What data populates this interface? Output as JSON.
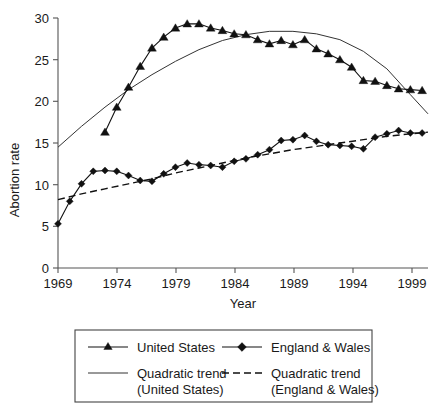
{
  "chart_data": {
    "type": "line",
    "title": "",
    "xlabel": "Year",
    "ylabel": "Abortion rate",
    "xlim": [
      1969,
      2000.5
    ],
    "ylim": [
      0,
      30
    ],
    "xticks": [
      1969,
      1974,
      1979,
      1984,
      1989,
      1994,
      1999
    ],
    "yticks": [
      0,
      5,
      10,
      15,
      20,
      25,
      30
    ],
    "grid": false,
    "legend_position": "below-plot",
    "series": [
      {
        "name": "United States",
        "marker": "triangle",
        "line_style": "solid",
        "x": [
          1973,
          1974,
          1975,
          1976,
          1977,
          1978,
          1979,
          1980,
          1981,
          1982,
          1983,
          1984,
          1985,
          1986,
          1987,
          1988,
          1989,
          1990,
          1991,
          1992,
          1993,
          1994,
          1995,
          1996,
          1997,
          1998,
          1999,
          2000
        ],
        "values": [
          16.3,
          19.3,
          21.7,
          24.2,
          26.4,
          27.7,
          28.8,
          29.3,
          29.3,
          28.8,
          28.5,
          28.1,
          28.0,
          27.4,
          26.9,
          27.3,
          26.8,
          27.4,
          26.3,
          25.7,
          25.0,
          24.1,
          22.5,
          22.4,
          21.9,
          21.5,
          21.4,
          21.3
        ]
      },
      {
        "name": "England & Wales",
        "marker": "diamond",
        "line_style": "solid",
        "x": [
          1969,
          1970,
          1971,
          1972,
          1973,
          1974,
          1975,
          1976,
          1977,
          1978,
          1979,
          1980,
          1981,
          1982,
          1983,
          1984,
          1985,
          1986,
          1987,
          1988,
          1989,
          1990,
          1991,
          1992,
          1993,
          1994,
          1995,
          1996,
          1997,
          1998,
          1999,
          2000
        ],
        "values": [
          5.3,
          8.0,
          10.1,
          11.6,
          11.7,
          11.6,
          11.1,
          10.5,
          10.4,
          11.3,
          12.1,
          12.6,
          12.4,
          12.3,
          12.1,
          12.8,
          13.1,
          13.6,
          14.2,
          15.3,
          15.4,
          15.9,
          15.2,
          14.8,
          14.7,
          14.6,
          14.3,
          15.7,
          16.1,
          16.5,
          16.2,
          16.2
        ]
      }
    ],
    "trends": [
      {
        "name": "Quadratic trend (United States)",
        "line_style": "solid",
        "x": [
          1969,
          1971,
          1973,
          1975,
          1977,
          1979,
          1981,
          1983,
          1985,
          1987,
          1989,
          1991,
          1993,
          1995,
          1997,
          1999,
          2000.5
        ],
        "values": [
          14.5,
          17.0,
          19.3,
          21.4,
          23.2,
          24.8,
          26.2,
          27.3,
          28.0,
          28.4,
          28.4,
          28.1,
          27.4,
          26.0,
          23.9,
          20.8,
          18.5
        ]
      },
      {
        "name": "Quadratic trend (England & Wales)",
        "line_style": "dashed",
        "x": [
          1969,
          1971,
          1973,
          1975,
          1977,
          1979,
          1981,
          1983,
          1985,
          1987,
          1989,
          1991,
          1993,
          1995,
          1997,
          1999,
          2000.5
        ],
        "values": [
          8.2,
          8.9,
          9.5,
          10.1,
          10.7,
          11.4,
          12.0,
          12.6,
          13.2,
          13.7,
          14.2,
          14.6,
          15.0,
          15.4,
          15.8,
          16.1,
          16.3
        ]
      }
    ]
  },
  "axes": {
    "y_label": "Abortion rate",
    "x_label": "Year",
    "y_tick_labels": [
      "0",
      "5",
      "10",
      "15",
      "20",
      "25",
      "30"
    ],
    "x_tick_labels": [
      "1969",
      "1974",
      "1979",
      "1984",
      "1989",
      "1994",
      "1999"
    ]
  },
  "legend": {
    "entries": [
      {
        "label": "United States",
        "marker": "triangle",
        "line": "solid"
      },
      {
        "label": "England & Wales",
        "marker": "diamond",
        "line": "solid"
      },
      {
        "label": "Quadratic trend",
        "sublabel": "(United States)",
        "marker": "none",
        "line": "solid"
      },
      {
        "label": "Quadratic trend",
        "sublabel": "(England & Wales)",
        "marker": "none",
        "line": "dashed"
      }
    ]
  },
  "colors": {
    "ink": "#111111",
    "axis": "#555555",
    "background": "#ffffff"
  }
}
